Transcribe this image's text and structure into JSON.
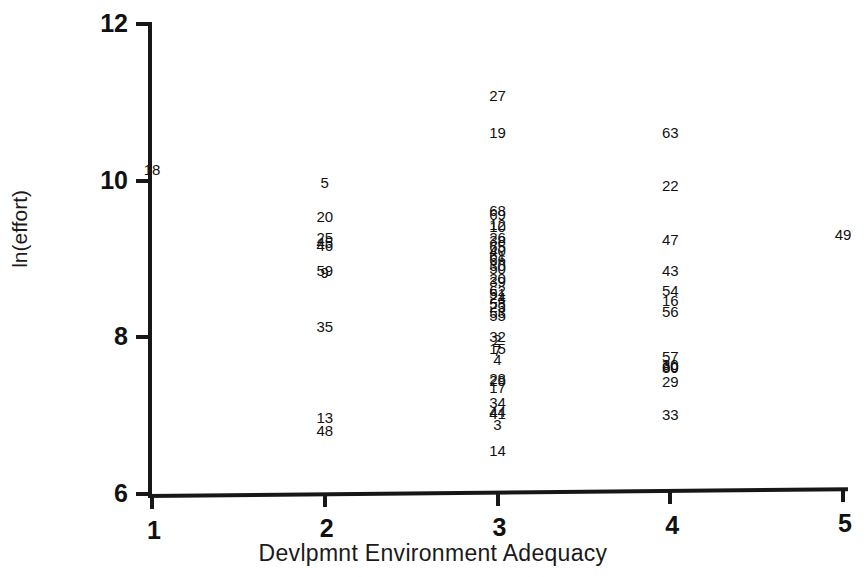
{
  "chart_data": {
    "type": "scatter",
    "title": "",
    "xlabel": "Devlpmnt Environment Adequacy",
    "ylabel": "ln(effort)",
    "xlim": [
      1,
      5
    ],
    "ylim": [
      6,
      12
    ],
    "xticks": [
      "1",
      "2",
      "3",
      "4",
      "5"
    ],
    "yticks": [
      "6",
      "8",
      "10",
      "12"
    ],
    "grid": false,
    "legend": null,
    "point_label_note": "Each plotted marker is rendered as its case-number label; dense columns overlap.",
    "points": [
      {
        "label": "18",
        "x": 1.0,
        "y": 10.15
      },
      {
        "label": "5",
        "x": 2.0,
        "y": 9.98
      },
      {
        "label": "20",
        "x": 2.0,
        "y": 9.55
      },
      {
        "label": "25",
        "x": 2.0,
        "y": 9.28
      },
      {
        "label": "45",
        "x": 2.0,
        "y": 9.22
      },
      {
        "label": "46",
        "x": 2.0,
        "y": 9.18
      },
      {
        "label": "59",
        "x": 2.0,
        "y": 8.86
      },
      {
        "label": "9",
        "x": 2.0,
        "y": 8.84
      },
      {
        "label": "35",
        "x": 2.0,
        "y": 8.14
      },
      {
        "label": "13",
        "x": 2.0,
        "y": 6.98
      },
      {
        "label": "48",
        "x": 2.0,
        "y": 6.82
      },
      {
        "label": "27",
        "x": 3.0,
        "y": 11.1
      },
      {
        "label": "19",
        "x": 3.0,
        "y": 10.62
      },
      {
        "label": "68",
        "x": 3.0,
        "y": 9.62
      },
      {
        "label": "69",
        "x": 3.0,
        "y": 9.58
      },
      {
        "label": "12",
        "x": 3.0,
        "y": 9.45
      },
      {
        "label": "10",
        "x": 3.0,
        "y": 9.42
      },
      {
        "label": "26",
        "x": 3.0,
        "y": 9.28
      },
      {
        "label": "38",
        "x": 3.0,
        "y": 9.24
      },
      {
        "label": "65",
        "x": 3.0,
        "y": 9.16
      },
      {
        "label": "40",
        "x": 3.0,
        "y": 9.12
      },
      {
        "label": "61",
        "x": 3.0,
        "y": 9.05
      },
      {
        "label": "66",
        "x": 3.0,
        "y": 9.0
      },
      {
        "label": "30",
        "x": 3.0,
        "y": 8.92
      },
      {
        "label": "50",
        "x": 3.0,
        "y": 8.88
      },
      {
        "label": "20",
        "x": 3.0,
        "y": 8.76
      },
      {
        "label": "39",
        "x": 3.0,
        "y": 8.72
      },
      {
        "label": "62",
        "x": 3.0,
        "y": 8.6
      },
      {
        "label": "51",
        "x": 3.0,
        "y": 8.56
      },
      {
        "label": "24",
        "x": 3.0,
        "y": 8.52
      },
      {
        "label": "58",
        "x": 3.0,
        "y": 8.44
      },
      {
        "label": "23",
        "x": 3.0,
        "y": 8.4
      },
      {
        "label": "53",
        "x": 3.0,
        "y": 8.32
      },
      {
        "label": "55",
        "x": 3.0,
        "y": 8.28
      },
      {
        "label": "32",
        "x": 3.0,
        "y": 8.02
      },
      {
        "label": "2",
        "x": 3.0,
        "y": 7.98
      },
      {
        "label": "15",
        "x": 3.0,
        "y": 7.86
      },
      {
        "label": "7",
        "x": 3.0,
        "y": 7.84
      },
      {
        "label": "4",
        "x": 3.0,
        "y": 7.72
      },
      {
        "label": "28",
        "x": 3.0,
        "y": 7.48
      },
      {
        "label": "29",
        "x": 3.0,
        "y": 7.46
      },
      {
        "label": "17",
        "x": 3.0,
        "y": 7.36
      },
      {
        "label": "34",
        "x": 3.0,
        "y": 7.18
      },
      {
        "label": "44",
        "x": 3.0,
        "y": 7.06
      },
      {
        "label": "41",
        "x": 3.0,
        "y": 7.04
      },
      {
        "label": "3",
        "x": 3.0,
        "y": 6.9
      },
      {
        "label": "14",
        "x": 3.0,
        "y": 6.56
      },
      {
        "label": "63",
        "x": 4.0,
        "y": 10.62
      },
      {
        "label": "22",
        "x": 4.0,
        "y": 9.95
      },
      {
        "label": "47",
        "x": 4.0,
        "y": 9.25
      },
      {
        "label": "43",
        "x": 4.0,
        "y": 8.86
      },
      {
        "label": "54",
        "x": 4.0,
        "y": 8.6
      },
      {
        "label": "16",
        "x": 4.0,
        "y": 8.48
      },
      {
        "label": "56",
        "x": 4.0,
        "y": 8.34
      },
      {
        "label": "57",
        "x": 4.0,
        "y": 7.76
      },
      {
        "label": "30",
        "x": 4.0,
        "y": 7.66
      },
      {
        "label": "60",
        "x": 4.0,
        "y": 7.64
      },
      {
        "label": "80",
        "x": 4.0,
        "y": 7.62
      },
      {
        "label": "29",
        "x": 4.0,
        "y": 7.44
      },
      {
        "label": "33",
        "x": 4.0,
        "y": 7.02
      },
      {
        "label": "49",
        "x": 5.0,
        "y": 9.32
      }
    ]
  }
}
